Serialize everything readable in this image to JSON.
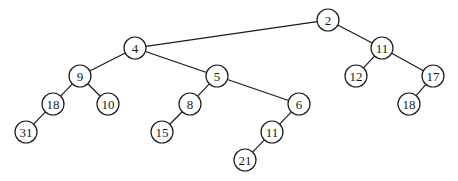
{
  "diagram": {
    "type": "tree",
    "style": {
      "line_color": "#1a1a1a",
      "node_fill": "#ffffff",
      "node_radius": 11
    },
    "nodes": [
      {
        "id": "n2",
        "label": "2",
        "x": 328,
        "y": 20
      },
      {
        "id": "n4",
        "label": "4",
        "x": 135,
        "y": 48
      },
      {
        "id": "n11a",
        "label": "11",
        "x": 382,
        "y": 48
      },
      {
        "id": "n9",
        "label": "9",
        "x": 80,
        "y": 76
      },
      {
        "id": "n5",
        "label": "5",
        "x": 217,
        "y": 76
      },
      {
        "id": "n12",
        "label": "12",
        "x": 356,
        "y": 76
      },
      {
        "id": "n17",
        "label": "17",
        "x": 433,
        "y": 76
      },
      {
        "id": "n18a",
        "label": "18",
        "x": 53,
        "y": 104
      },
      {
        "id": "n10",
        "label": "10",
        "x": 108,
        "y": 104
      },
      {
        "id": "n8",
        "label": "8",
        "x": 190,
        "y": 104
      },
      {
        "id": "n6",
        "label": "6",
        "x": 299,
        "y": 104
      },
      {
        "id": "n18b",
        "label": "18",
        "x": 409,
        "y": 104
      },
      {
        "id": "n31",
        "label": "31",
        "x": 26,
        "y": 132
      },
      {
        "id": "n15",
        "label": "15",
        "x": 162,
        "y": 132
      },
      {
        "id": "n11b",
        "label": "11",
        "x": 272,
        "y": 132
      },
      {
        "id": "n21",
        "label": "21",
        "x": 245,
        "y": 160
      }
    ],
    "edges": [
      {
        "from": "n2",
        "to": "n4"
      },
      {
        "from": "n2",
        "to": "n11a"
      },
      {
        "from": "n4",
        "to": "n9"
      },
      {
        "from": "n4",
        "to": "n5"
      },
      {
        "from": "n11a",
        "to": "n12"
      },
      {
        "from": "n11a",
        "to": "n17"
      },
      {
        "from": "n9",
        "to": "n18a"
      },
      {
        "from": "n9",
        "to": "n10"
      },
      {
        "from": "n5",
        "to": "n8"
      },
      {
        "from": "n5",
        "to": "n6"
      },
      {
        "from": "n17",
        "to": "n18b"
      },
      {
        "from": "n18a",
        "to": "n31"
      },
      {
        "from": "n8",
        "to": "n15"
      },
      {
        "from": "n6",
        "to": "n11b"
      },
      {
        "from": "n11b",
        "to": "n21"
      }
    ]
  }
}
